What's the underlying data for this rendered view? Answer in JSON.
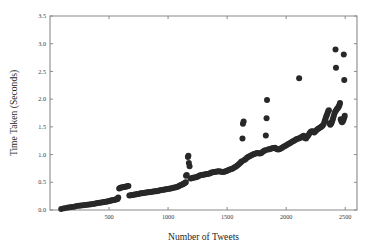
{
  "chart_data": {
    "type": "scatter",
    "title": "",
    "xlabel": "Number of Tweets",
    "ylabel": "Time Taken (Seconds)",
    "xlim": [
      0,
      2600
    ],
    "ylim": [
      0.0,
      3.5
    ],
    "xticks": [
      500,
      1000,
      1500,
      2000,
      2500
    ],
    "xtick_labels": [
      "500",
      "1000",
      "1500",
      "2000",
      "2500"
    ],
    "yticks": [
      0.0,
      0.5,
      1.0,
      1.5,
      2.0,
      2.5,
      3.0,
      3.5
    ],
    "ytick_labels": [
      "0.0",
      "0.5",
      "1.0",
      "1.5",
      "2.0",
      "2.5",
      "3.0",
      "3.5"
    ],
    "grid": false,
    "legend": false,
    "marker_color": "#282828",
    "marker_size": 3.0,
    "axis_color": "#8a8a8a",
    "background_color": "#ffffff",
    "series": [
      {
        "name": "Time Taken",
        "points": [
          [
            95,
            0.02
          ],
          [
            120,
            0.03
          ],
          [
            145,
            0.04
          ],
          [
            165,
            0.05
          ],
          [
            185,
            0.055
          ],
          [
            205,
            0.06
          ],
          [
            225,
            0.07
          ],
          [
            245,
            0.075
          ],
          [
            262,
            0.08
          ],
          [
            280,
            0.085
          ],
          [
            298,
            0.09
          ],
          [
            315,
            0.095
          ],
          [
            332,
            0.1
          ],
          [
            348,
            0.105
          ],
          [
            362,
            0.11
          ],
          [
            378,
            0.115
          ],
          [
            392,
            0.12
          ],
          [
            406,
            0.125
          ],
          [
            420,
            0.13
          ],
          [
            434,
            0.135
          ],
          [
            448,
            0.14
          ],
          [
            460,
            0.145
          ],
          [
            472,
            0.15
          ],
          [
            484,
            0.155
          ],
          [
            496,
            0.16
          ],
          [
            508,
            0.165
          ],
          [
            518,
            0.17
          ],
          [
            528,
            0.175
          ],
          [
            538,
            0.18
          ],
          [
            548,
            0.185
          ],
          [
            556,
            0.19
          ],
          [
            564,
            0.195
          ],
          [
            572,
            0.2
          ],
          [
            578,
            0.225
          ],
          [
            586,
            0.39
          ],
          [
            596,
            0.4
          ],
          [
            606,
            0.405
          ],
          [
            616,
            0.41
          ],
          [
            626,
            0.415
          ],
          [
            636,
            0.42
          ],
          [
            646,
            0.425
          ],
          [
            656,
            0.43
          ],
          [
            664,
            0.435
          ],
          [
            672,
            0.26
          ],
          [
            684,
            0.265
          ],
          [
            696,
            0.27
          ],
          [
            708,
            0.275
          ],
          [
            720,
            0.28
          ],
          [
            732,
            0.285
          ],
          [
            744,
            0.29
          ],
          [
            756,
            0.295
          ],
          [
            768,
            0.3
          ],
          [
            780,
            0.303
          ],
          [
            792,
            0.307
          ],
          [
            804,
            0.31
          ],
          [
            816,
            0.315
          ],
          [
            828,
            0.32
          ],
          [
            840,
            0.322
          ],
          [
            852,
            0.325
          ],
          [
            864,
            0.33
          ],
          [
            876,
            0.333
          ],
          [
            888,
            0.337
          ],
          [
            900,
            0.34
          ],
          [
            912,
            0.345
          ],
          [
            924,
            0.35
          ],
          [
            936,
            0.355
          ],
          [
            948,
            0.36
          ],
          [
            960,
            0.365
          ],
          [
            972,
            0.37
          ],
          [
            984,
            0.375
          ],
          [
            996,
            0.378
          ],
          [
            1008,
            0.382
          ],
          [
            1020,
            0.387
          ],
          [
            1032,
            0.392
          ],
          [
            1044,
            0.4
          ],
          [
            1056,
            0.405
          ],
          [
            1068,
            0.412
          ],
          [
            1080,
            0.42
          ],
          [
            1090,
            0.43
          ],
          [
            1100,
            0.44
          ],
          [
            1110,
            0.45
          ],
          [
            1120,
            0.46
          ],
          [
            1128,
            0.47
          ],
          [
            1136,
            0.48
          ],
          [
            1144,
            0.49
          ],
          [
            1150,
            0.5
          ],
          [
            1152,
            0.62
          ],
          [
            1158,
            0.63
          ],
          [
            1168,
            0.955
          ],
          [
            1172,
            0.98
          ],
          [
            1176,
            0.85
          ],
          [
            1182,
            0.79
          ],
          [
            1190,
            0.57
          ],
          [
            1200,
            0.575
          ],
          [
            1212,
            0.58
          ],
          [
            1224,
            0.585
          ],
          [
            1236,
            0.59
          ],
          [
            1248,
            0.6
          ],
          [
            1260,
            0.615
          ],
          [
            1272,
            0.625
          ],
          [
            1284,
            0.63
          ],
          [
            1296,
            0.635
          ],
          [
            1308,
            0.64
          ],
          [
            1320,
            0.645
          ],
          [
            1332,
            0.65
          ],
          [
            1344,
            0.655
          ],
          [
            1356,
            0.665
          ],
          [
            1368,
            0.675
          ],
          [
            1380,
            0.68
          ],
          [
            1392,
            0.685
          ],
          [
            1404,
            0.69
          ],
          [
            1416,
            0.695
          ],
          [
            1428,
            0.7
          ],
          [
            1440,
            0.695
          ],
          [
            1452,
            0.69
          ],
          [
            1464,
            0.685
          ],
          [
            1476,
            0.69
          ],
          [
            1488,
            0.7
          ],
          [
            1500,
            0.71
          ],
          [
            1512,
            0.72
          ],
          [
            1524,
            0.73
          ],
          [
            1536,
            0.74
          ],
          [
            1548,
            0.75
          ],
          [
            1560,
            0.765
          ],
          [
            1572,
            0.78
          ],
          [
            1584,
            0.8
          ],
          [
            1596,
            0.82
          ],
          [
            1608,
            0.845
          ],
          [
            1618,
            0.865
          ],
          [
            1626,
            0.88
          ],
          [
            1630,
            1.29
          ],
          [
            1634,
            1.555
          ],
          [
            1640,
            1.595
          ],
          [
            1646,
            0.9
          ],
          [
            1658,
            0.92
          ],
          [
            1670,
            0.945
          ],
          [
            1682,
            0.96
          ],
          [
            1694,
            0.975
          ],
          [
            1706,
            0.99
          ],
          [
            1718,
            1.0
          ],
          [
            1730,
            1.01
          ],
          [
            1742,
            1.02
          ],
          [
            1754,
            1.03
          ],
          [
            1766,
            1.025
          ],
          [
            1778,
            1.02
          ],
          [
            1790,
            1.03
          ],
          [
            1802,
            1.05
          ],
          [
            1814,
            1.07
          ],
          [
            1824,
            1.08
          ],
          [
            1828,
            1.345
          ],
          [
            1834,
            1.655
          ],
          [
            1838,
            1.985
          ],
          [
            1846,
            1.09
          ],
          [
            1858,
            1.095
          ],
          [
            1870,
            1.105
          ],
          [
            1882,
            1.115
          ],
          [
            1894,
            1.12
          ],
          [
            1906,
            1.125
          ],
          [
            1918,
            1.1
          ],
          [
            1930,
            1.09
          ],
          [
            1942,
            1.095
          ],
          [
            1954,
            1.11
          ],
          [
            1966,
            1.125
          ],
          [
            1978,
            1.14
          ],
          [
            1990,
            1.155
          ],
          [
            2002,
            1.17
          ],
          [
            2014,
            1.185
          ],
          [
            2026,
            1.2
          ],
          [
            2038,
            1.215
          ],
          [
            2050,
            1.23
          ],
          [
            2062,
            1.245
          ],
          [
            2074,
            1.26
          ],
          [
            2086,
            1.275
          ],
          [
            2098,
            1.285
          ],
          [
            2110,
            2.375
          ],
          [
            2112,
            1.295
          ],
          [
            2124,
            1.31
          ],
          [
            2136,
            1.325
          ],
          [
            2148,
            1.34
          ],
          [
            2158,
            1.3
          ],
          [
            2168,
            1.29
          ],
          [
            2178,
            1.32
          ],
          [
            2188,
            1.35
          ],
          [
            2198,
            1.385
          ],
          [
            2208,
            1.41
          ],
          [
            2218,
            1.42
          ],
          [
            2228,
            1.415
          ],
          [
            2238,
            1.4
          ],
          [
            2248,
            1.42
          ],
          [
            2258,
            1.445
          ],
          [
            2268,
            1.46
          ],
          [
            2278,
            1.475
          ],
          [
            2288,
            1.49
          ],
          [
            2298,
            1.5
          ],
          [
            2308,
            1.52
          ],
          [
            2318,
            1.55
          ],
          [
            2326,
            1.6
          ],
          [
            2332,
            1.64
          ],
          [
            2338,
            1.68
          ],
          [
            2344,
            1.71
          ],
          [
            2350,
            1.745
          ],
          [
            2356,
            1.78
          ],
          [
            2362,
            1.8
          ],
          [
            2368,
            1.565
          ],
          [
            2374,
            1.54
          ],
          [
            2380,
            1.555
          ],
          [
            2386,
            1.58
          ],
          [
            2392,
            1.62
          ],
          [
            2398,
            1.66
          ],
          [
            2404,
            1.7
          ],
          [
            2410,
            1.745
          ],
          [
            2416,
            1.775
          ],
          [
            2418,
            2.895
          ],
          [
            2422,
            2.565
          ],
          [
            2424,
            1.8
          ],
          [
            2430,
            1.82
          ],
          [
            2436,
            1.835
          ],
          [
            2442,
            1.855
          ],
          [
            2448,
            1.875
          ],
          [
            2452,
            1.9
          ],
          [
            2456,
            1.93
          ],
          [
            2462,
            1.635
          ],
          [
            2468,
            1.6
          ],
          [
            2474,
            1.585
          ],
          [
            2480,
            1.6
          ],
          [
            2486,
            1.63
          ],
          [
            2492,
            1.67
          ],
          [
            2496,
            1.7
          ],
          [
            2488,
            2.805
          ],
          [
            2492,
            2.345
          ]
        ]
      }
    ]
  },
  "axes": {
    "xlabel": "Number of Tweets",
    "ylabel": "Time Taken (Seconds)"
  }
}
